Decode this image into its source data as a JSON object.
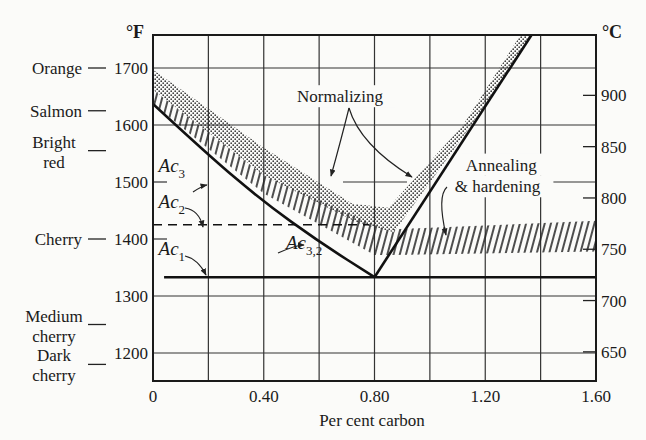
{
  "chart_data": {
    "type": "line",
    "title": "",
    "xlabel": "Per cent carbon",
    "ylabel_left": "°F",
    "ylabel_right": "°C",
    "xlim": [
      0,
      1.6
    ],
    "ylim_F": [
      1150,
      1760
    ],
    "x_ticks": [
      {
        "value": 0,
        "label": "0"
      },
      {
        "value": 0.4,
        "label": "0.40"
      },
      {
        "value": 0.8,
        "label": "0.80"
      },
      {
        "value": 1.2,
        "label": "1.20"
      },
      {
        "value": 1.6,
        "label": "1.60"
      }
    ],
    "x_grid": [
      0.2,
      0.4,
      0.6,
      0.8,
      1.0,
      1.2,
      1.4
    ],
    "y_ticks_F": [
      {
        "value": 1700,
        "label": "1700"
      },
      {
        "value": 1600,
        "label": "1600"
      },
      {
        "value": 1500,
        "label": "1500"
      },
      {
        "value": 1400,
        "label": "1400"
      },
      {
        "value": 1300,
        "label": "1300"
      },
      {
        "value": 1200,
        "label": "1200"
      }
    ],
    "y_ticks_C": [
      {
        "value": 900,
        "label": "900"
      },
      {
        "value": 850,
        "label": "850"
      },
      {
        "value": 800,
        "label": "800"
      },
      {
        "value": 750,
        "label": "750"
      },
      {
        "value": 700,
        "label": "700"
      },
      {
        "value": 650,
        "label": "650"
      }
    ],
    "color_scale": [
      {
        "lines": [
          "Orange"
        ],
        "temp_F": 1700
      },
      {
        "lines": [
          "Salmon"
        ],
        "temp_F": 1625
      },
      {
        "lines": [
          "Bright",
          "red"
        ],
        "temp_F": 1555
      },
      {
        "lines": [
          "Cherry"
        ],
        "temp_F": 1400
      },
      {
        "lines": [
          "Medium",
          "cherry"
        ],
        "temp_F": 1250
      },
      {
        "lines": [
          "Dark",
          "cherry"
        ],
        "temp_F": 1180
      }
    ],
    "series": [
      {
        "name": "Ac3 / Ac3,2",
        "style": "solid-thick",
        "points": [
          [
            0,
            1637
          ],
          [
            0.2,
            1547
          ],
          [
            0.4,
            1465
          ],
          [
            0.6,
            1395
          ],
          [
            0.8,
            1333
          ]
        ]
      },
      {
        "name": "Acm",
        "style": "solid-thick",
        "points": [
          [
            0.8,
            1333
          ],
          [
            1.37,
            1760
          ]
        ]
      },
      {
        "name": "Ac1",
        "style": "solid-thick",
        "points": [
          [
            0.04,
            1333
          ],
          [
            1.6,
            1333
          ]
        ]
      },
      {
        "name": "Ac2",
        "style": "dashed",
        "points": [
          [
            0,
            1425
          ],
          [
            0.78,
            1425
          ]
        ]
      }
    ],
    "bands": [
      {
        "name": "Annealing & hardening (hypoeutectoid)",
        "fill": "hatch",
        "upper": [
          [
            0,
            1662
          ],
          [
            0.4,
            1512
          ],
          [
            0.8,
            1425
          ],
          [
            0.87,
            1412
          ]
        ],
        "lower": [
          [
            0,
            1637
          ],
          [
            0.4,
            1480
          ],
          [
            0.8,
            1372
          ],
          [
            0.87,
            1372
          ]
        ]
      },
      {
        "name": "Annealing & hardening (hypereutectoid)",
        "fill": "hatch",
        "upper": [
          [
            0.87,
            1417
          ],
          [
            1.6,
            1432
          ]
        ],
        "lower": [
          [
            0.87,
            1372
          ],
          [
            1.6,
            1378
          ]
        ]
      },
      {
        "name": "Normalizing",
        "fill": "stipple",
        "upper": [
          [
            0,
            1697
          ],
          [
            0.4,
            1560
          ],
          [
            0.72,
            1462
          ],
          [
            0.85,
            1455
          ],
          [
            1.12,
            1600
          ],
          [
            1.33,
            1760
          ]
        ],
        "lower": [
          [
            0,
            1662
          ],
          [
            0.4,
            1512
          ],
          [
            0.74,
            1428
          ],
          [
            0.87,
            1412
          ],
          [
            1.15,
            1600
          ],
          [
            1.37,
            1760
          ]
        ]
      }
    ],
    "annotations": [
      {
        "text": "Ac",
        "sub": "3",
        "x": 0.02,
        "F": 1518
      },
      {
        "text": "Ac",
        "sub": "2",
        "x": 0.02,
        "F": 1455
      },
      {
        "text": "Ac",
        "sub": "1",
        "x": 0.02,
        "F": 1372
      },
      {
        "text": "Ac",
        "sub": "3,2",
        "x": 0.48,
        "F": 1382
      },
      {
        "text": "Normalizing",
        "x": 0.52,
        "F": 1640
      },
      {
        "text": "Annealing",
        "x": 1.13,
        "F": 1520
      },
      {
        "text": "& hardening",
        "x": 1.09,
        "F": 1482
      }
    ],
    "grid": true,
    "legend": "none"
  }
}
